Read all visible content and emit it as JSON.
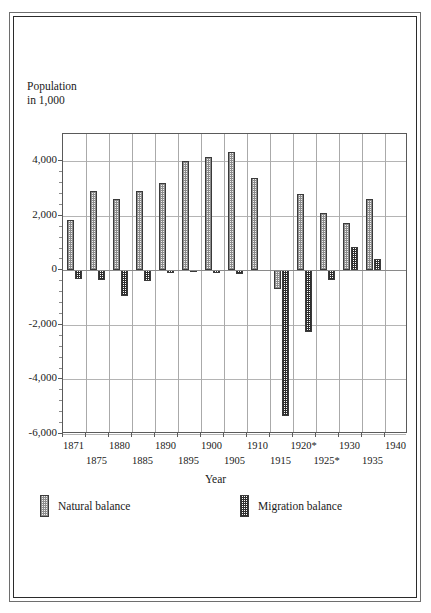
{
  "chart_data": {
    "type": "bar",
    "title": "",
    "ylabel": "Population\nin 1,000",
    "xlabel": "Year",
    "categories": [
      "1871",
      "1875",
      "1880",
      "1885",
      "1890",
      "1895",
      "1900",
      "1905",
      "1910",
      "1915",
      "1920*",
      "1925*",
      "1930",
      "1935",
      "1940"
    ],
    "ylim": [
      -6000,
      5000
    ],
    "yticks": [
      4000,
      2000,
      0,
      -2000,
      -4000,
      -6000
    ],
    "ytick_labels": [
      "4,000",
      "2,000",
      "0",
      "-2,000",
      "-4,000",
      "-6,000"
    ],
    "grid": true,
    "legend_position": "bottom",
    "series": [
      {
        "name": "Natural balance",
        "values": [
          1850,
          2900,
          2600,
          2900,
          3200,
          4000,
          4150,
          4350,
          3400,
          -700,
          2800,
          2100,
          1750,
          2600,
          0
        ]
      },
      {
        "name": "Migration balance",
        "values": [
          -300,
          -350,
          -950,
          -400,
          -100,
          -60,
          -80,
          -130,
          0,
          -5350,
          -2250,
          -350,
          850,
          400,
          0
        ]
      }
    ]
  },
  "legend": {
    "natural_label": "Natural balance",
    "migration_label": "Migration balance"
  },
  "colors": {
    "natural_fill": "#f2f2f2",
    "natural_hatch": "#8d8d8d",
    "migration_fill": "#ffffff",
    "migration_hatch": "#2f2f2f",
    "border": "#3a3a3a",
    "grid": "#b4b4b4",
    "axis": "#5a5a5a"
  }
}
